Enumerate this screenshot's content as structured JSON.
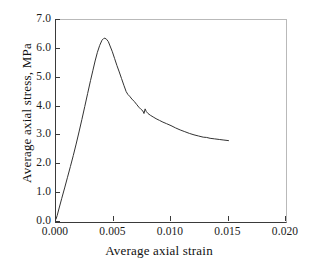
{
  "chart_data": {
    "type": "line",
    "title": "",
    "subtitle": "",
    "xlabel": "Average axial strain",
    "ylabel": "Average axial stress, MPa",
    "xlim": [
      0.0,
      0.02
    ],
    "ylim": [
      0.0,
      7.0
    ],
    "xticks": [
      "0.000",
      "0.005",
      "0.010",
      "0.015",
      "0.020"
    ],
    "xtick_values": [
      0.0,
      0.005,
      0.01,
      0.015,
      0.02
    ],
    "yticks": [
      "0.0",
      "1.0",
      "2.0",
      "3.0",
      "4.0",
      "5.0",
      "6.0",
      "7.0"
    ],
    "ytick_values": [
      0.0,
      1.0,
      2.0,
      3.0,
      4.0,
      5.0,
      6.0,
      7.0
    ],
    "grid": false,
    "legend": "none",
    "line_color": "#333333",
    "line_width": 1.0,
    "series": [
      {
        "name": "axial stress-strain",
        "x": [
          0.0,
          0.0001,
          0.00025,
          0.0005,
          0.00075,
          0.001,
          0.00125,
          0.0015,
          0.00175,
          0.002,
          0.00225,
          0.0025,
          0.00275,
          0.003,
          0.0032,
          0.0034,
          0.0036,
          0.0038,
          0.004,
          0.00415,
          0.00425,
          0.0044,
          0.00455,
          0.0047,
          0.0049,
          0.0051,
          0.0053,
          0.0055,
          0.0057,
          0.0059,
          0.0061,
          0.00625,
          0.0064,
          0.0066,
          0.0068,
          0.007,
          0.0072,
          0.0074,
          0.00755,
          0.00765,
          0.00775,
          0.00785,
          0.008,
          0.0082,
          0.00845,
          0.0087,
          0.009,
          0.0093,
          0.0096,
          0.01,
          0.0104,
          0.0108,
          0.0112,
          0.0116,
          0.012,
          0.0124,
          0.0128,
          0.0131,
          0.0134,
          0.0138,
          0.0142,
          0.0146,
          0.015
        ],
        "y": [
          0.1,
          0.22,
          0.45,
          0.82,
          1.18,
          1.55,
          1.92,
          2.3,
          2.7,
          3.12,
          3.55,
          4.0,
          4.45,
          4.9,
          5.24,
          5.58,
          5.88,
          6.12,
          6.3,
          6.36,
          6.37,
          6.33,
          6.25,
          6.1,
          5.9,
          5.66,
          5.42,
          5.2,
          4.97,
          4.74,
          4.52,
          4.42,
          4.36,
          4.26,
          4.18,
          4.08,
          3.98,
          3.9,
          3.85,
          3.76,
          3.92,
          3.83,
          3.76,
          3.7,
          3.64,
          3.58,
          3.52,
          3.46,
          3.41,
          3.34,
          3.26,
          3.19,
          3.13,
          3.07,
          3.02,
          2.98,
          2.94,
          2.93,
          2.9,
          2.88,
          2.86,
          2.84,
          2.82
        ]
      }
    ],
    "annotations": [
      {
        "label": "peak",
        "x": 0.00425,
        "y": 6.37
      },
      {
        "label": "kink",
        "x": 0.00775,
        "y": 3.92
      },
      {
        "label": "end",
        "x": 0.015,
        "y": 2.82
      }
    ]
  },
  "axes": {
    "x": {
      "label": "Average axial strain",
      "ticks": [
        {
          "text": "0.000",
          "value": 0.0
        },
        {
          "text": "0.005",
          "value": 0.005
        },
        {
          "text": "0.010",
          "value": 0.01
        },
        {
          "text": "0.015",
          "value": 0.015
        },
        {
          "text": "0.020",
          "value": 0.02
        }
      ]
    },
    "y": {
      "label": "Average axial stress, MPa",
      "ticks": [
        {
          "text": "7.0",
          "value": 7.0
        },
        {
          "text": "6.0",
          "value": 6.0
        },
        {
          "text": "5.0",
          "value": 5.0
        },
        {
          "text": "4.0",
          "value": 4.0
        },
        {
          "text": "3.0",
          "value": 3.0
        },
        {
          "text": "2.0",
          "value": 2.0
        },
        {
          "text": "1.0",
          "value": 1.0
        },
        {
          "text": "0.0",
          "value": 0.0
        }
      ]
    }
  }
}
